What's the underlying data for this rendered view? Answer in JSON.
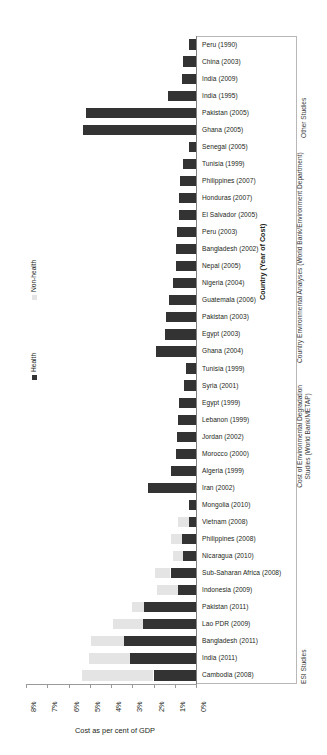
{
  "chart_data": {
    "type": "bar",
    "orientation": "horizontal-reversed",
    "title": "",
    "xlabel": "Cost as per cent of GDP",
    "ylabel": "Country (Year of Cost)",
    "xlim": [
      8,
      0
    ],
    "xticks": [
      "8%",
      "7%",
      "6%",
      "5%",
      "4%",
      "3%",
      "2%",
      "1%",
      "0%"
    ],
    "xtick_values": [
      8,
      7,
      6,
      5,
      4,
      3,
      2,
      1,
      0
    ],
    "grid": false,
    "legend_position": "left-outside",
    "series": [
      {
        "name": "Health",
        "color": "#333333"
      },
      {
        "name": "Non-health",
        "color": "#e4e4e4"
      }
    ],
    "categories": [
      "Peru (1990)",
      "China (2003)",
      "India (2009)",
      "India (1995)",
      "Pakistan (2005)",
      "Ghana (2005)",
      "Senegal (2005)",
      "Tunisia (1999)",
      "Philippines (2007)",
      "Honduras (2007)",
      "El Salvador (2005)",
      "Peru (2003)",
      "Bangladesh  (2002)",
      "Nepal (2005)",
      "Nigeria (2004)",
      "Guatemala (2006)",
      "Pakistan (2003)",
      "Egypt  (2003)",
      "Ghana (2004)",
      "Tunisia (1999)",
      "Syria (2001)",
      "Egypt (1999)",
      "Lebanon (1999)",
      "Jordan (2002)",
      "Morocco (2000)",
      "Algeria (1999)",
      "Iran (2002)",
      "Mongolia (2010)",
      "Vietnam (2008)",
      "Philippines (2008)",
      "Nicaragua (2010)",
      "Sub-Saharan Africa (2008)",
      "Indonesia (2009)",
      "Pakistan (2011)",
      "Lao PDR (2009)",
      "Bangladesh (2011)",
      "India (2011)",
      "Cambodia (2008)"
    ],
    "health_values": [
      0.35,
      0.6,
      0.65,
      1.3,
      5.2,
      5.3,
      0.35,
      0.6,
      0.75,
      0.8,
      0.8,
      0.9,
      0.95,
      0.95,
      1.1,
      1.25,
      1.4,
      1.45,
      1.9,
      0.45,
      0.55,
      0.8,
      0.85,
      0.9,
      0.95,
      1.2,
      2.25,
      0.35,
      0.35,
      0.65,
      0.6,
      1.2,
      0.85,
      2.45,
      2.5,
      3.4,
      3.1,
      2.0
    ],
    "nonhealth_values": [
      0,
      0,
      0,
      0,
      0,
      0,
      0,
      0,
      0,
      0,
      0,
      0,
      0,
      0,
      0,
      0,
      0,
      0,
      0,
      0,
      0,
      0,
      0,
      0,
      0,
      0,
      0,
      0,
      0.5,
      0.55,
      0.5,
      0.75,
      1.0,
      0.55,
      1.4,
      1.55,
      1.95,
      3.35
    ],
    "group_annotations": [
      {
        "label": "Other Studies",
        "start_index": 0,
        "end_index": 5
      },
      {
        "label": "Country Environmental Analyses (World Bank/Environment Department)",
        "start_index": 6,
        "end_index": 19
      },
      {
        "label": "Cost of Environmental Degradation Studies (World Bank/METAP)",
        "start_index": 20,
        "end_index": 26
      },
      {
        "label": "ESI Studies",
        "start_index": 27,
        "end_index": 37
      }
    ]
  }
}
